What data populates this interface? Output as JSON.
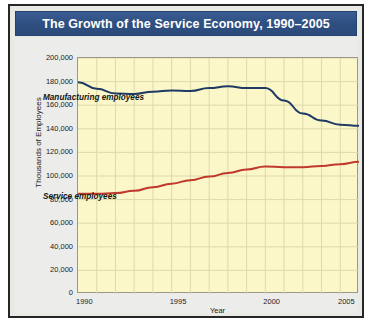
{
  "figure": {
    "title": "The Growth of the Service Economy, 1990–2005",
    "title_bar_color": "#2f4f81",
    "plot_background_color": "#fbf7c9",
    "card_background_color": "#ececeb"
  },
  "chart_data": {
    "type": "line",
    "title": "The Growth of the Service Economy, 1990–2005",
    "xlabel": "Year",
    "ylabel": "Thousands of Employees",
    "xlim": [
      1990,
      2005
    ],
    "ylim": [
      0,
      200000
    ],
    "grid": true,
    "legend": "inline-annotations",
    "x_ticks": [
      "1990",
      "1995",
      "2000",
      "2005"
    ],
    "x_tick_values": [
      1990,
      1995,
      2000,
      2005
    ],
    "y_ticks": [
      "0",
      "20,000",
      "40,000",
      "60,000",
      "80,000",
      "100,000",
      "120,000",
      "140,000",
      "160,000",
      "180,000",
      "200,000"
    ],
    "y_tick_values": [
      0,
      20000,
      40000,
      60000,
      80000,
      100000,
      120000,
      140000,
      160000,
      180000,
      200000
    ],
    "x": [
      1990,
      1991,
      1992,
      1993,
      1994,
      1995,
      1996,
      1997,
      1998,
      1999,
      2000,
      2001,
      2002,
      2003,
      2004,
      2005
    ],
    "series": [
      {
        "name": "Manufacturing employees",
        "color": "#1f3a63",
        "values": [
          179500,
          174000,
          170000,
          169500,
          171500,
          172500,
          172000,
          174500,
          176000,
          174500,
          174500,
          164000,
          153000,
          147000,
          143500,
          142500
        ]
      },
      {
        "name": "Service employees",
        "color": "#c0392b",
        "values": [
          85000,
          85000,
          85500,
          87500,
          90500,
          93500,
          96500,
          99500,
          102500,
          105500,
          108000,
          107500,
          107500,
          108500,
          110000,
          112000
        ]
      }
    ],
    "annotations": [
      {
        "text": "Manufacturing employees",
        "x": 1991.2,
        "y": 158000
      },
      {
        "text": "Service employees",
        "x": 1991.2,
        "y": 74000
      }
    ]
  }
}
